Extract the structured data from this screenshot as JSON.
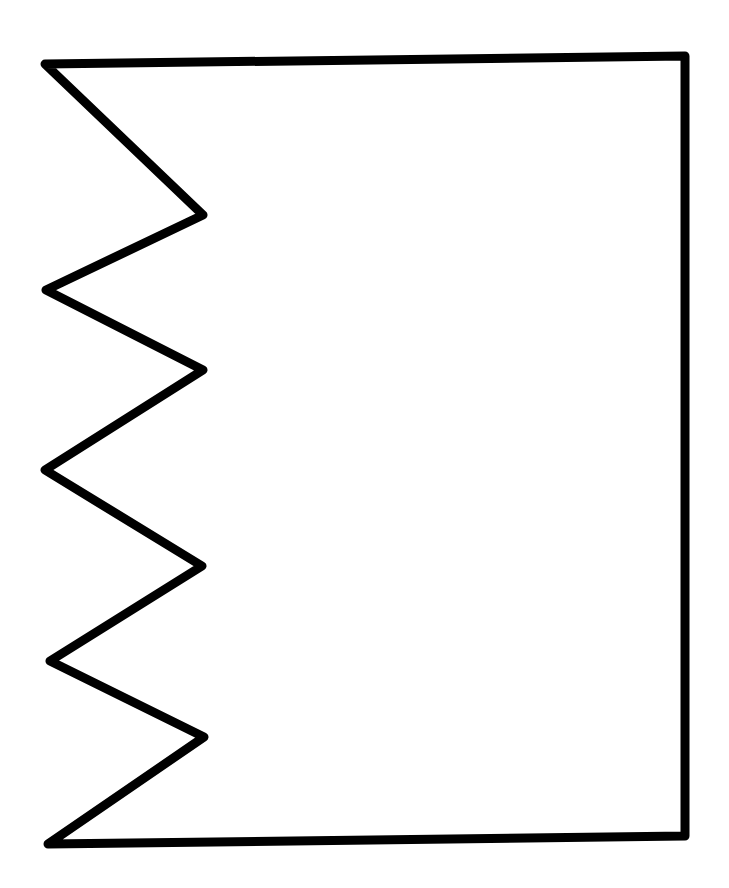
{
  "diagram": {
    "type": "outline-shape",
    "canvas": {
      "width": 729,
      "height": 888,
      "background": "#ffffff"
    },
    "stroke": {
      "color": "#000000",
      "width": 9,
      "linejoin": "round",
      "linecap": "round"
    },
    "fill": "#ffffff",
    "vertices": [
      [
        45,
        64
      ],
      [
        685,
        56
      ],
      [
        685,
        836
      ],
      [
        48,
        844
      ],
      [
        204,
        737
      ],
      [
        50,
        661
      ],
      [
        202,
        566
      ],
      [
        45,
        470
      ],
      [
        203,
        370
      ],
      [
        46,
        290
      ],
      [
        203,
        215
      ]
    ]
  }
}
